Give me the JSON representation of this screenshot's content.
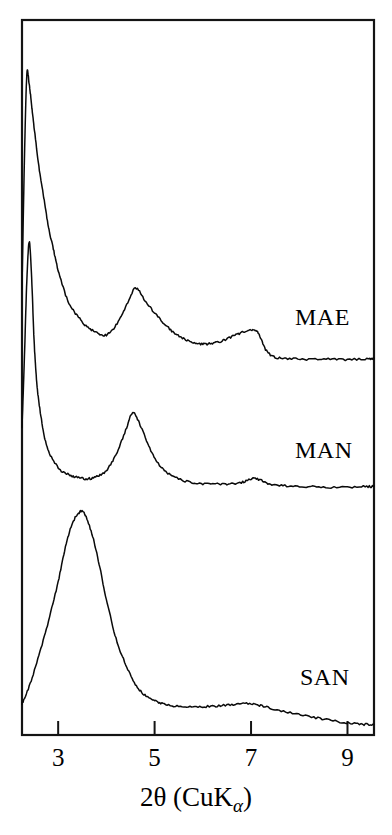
{
  "figure": {
    "name": "xrd-diffractogram",
    "background_color": "#ffffff",
    "line_color": "#0a0a0a",
    "frame_color": "#141414"
  },
  "axis": {
    "title_main": "2θ (CuK",
    "title_sub": "α",
    "title_close": ")",
    "title_full": "2θ (CuKα)",
    "tick_labels": [
      "3",
      "5",
      "7",
      "9"
    ]
  },
  "series_labels": {
    "mae": "MAE",
    "man": "MAN",
    "san": "SAN"
  },
  "chart_data": {
    "type": "line",
    "title": "",
    "subtitle": "",
    "xlabel": "2θ (CuKα)",
    "ylabel": "",
    "xlim": [
      2.25,
      9.55
    ],
    "ylim": [
      0,
      1
    ],
    "xticks": [
      3,
      5,
      7,
      9
    ],
    "yticks": [],
    "grid": false,
    "legend_position": "inline-right",
    "y_axis_note": "Intensity in arbitrary units; traces are vertically offset and not labeled.",
    "annotations": [
      {
        "text": "MAE",
        "x": 8.25,
        "series": "MAE"
      },
      {
        "text": "MAN",
        "x": 8.25,
        "series": "MAN"
      },
      {
        "text": "SAN",
        "x": 8.35,
        "series": "SAN"
      }
    ],
    "series": [
      {
        "name": "MAE",
        "offset_note": "top trace",
        "peaks": [
          {
            "x": 2.35,
            "relative_height": 1.0,
            "shape": "sharp"
          },
          {
            "x": 4.6,
            "relative_height": 0.3,
            "shape": "broad"
          },
          {
            "x": 7.0,
            "relative_height": 0.16,
            "shape": "broad"
          }
        ],
        "x": [
          2.25,
          2.3,
          2.35,
          2.4,
          2.45,
          2.5,
          2.6,
          2.7,
          2.8,
          2.9,
          3.0,
          3.2,
          3.4,
          3.6,
          3.8,
          4.0,
          4.2,
          4.4,
          4.6,
          4.8,
          5.0,
          5.2,
          5.4,
          5.6,
          5.8,
          6.0,
          6.2,
          6.4,
          6.6,
          6.8,
          7.0,
          7.15,
          7.3,
          7.5,
          7.8,
          8.2,
          8.6,
          9.0,
          9.4,
          9.55
        ],
        "y": [
          0.3,
          0.72,
          1.0,
          0.97,
          0.9,
          0.83,
          0.7,
          0.6,
          0.5,
          0.43,
          0.36,
          0.26,
          0.21,
          0.175,
          0.155,
          0.148,
          0.18,
          0.24,
          0.3,
          0.26,
          0.22,
          0.185,
          0.155,
          0.135,
          0.122,
          0.118,
          0.12,
          0.128,
          0.142,
          0.155,
          0.165,
          0.155,
          0.1,
          0.075,
          0.07,
          0.068,
          0.068,
          0.067,
          0.07,
          0.07
        ]
      },
      {
        "name": "MAN",
        "offset_note": "middle trace",
        "peaks": [
          {
            "x": 2.4,
            "relative_height": 1.0,
            "shape": "very sharp"
          },
          {
            "x": 4.6,
            "relative_height": 0.34,
            "shape": "moderate"
          },
          {
            "x": 7.0,
            "relative_height": 0.08,
            "shape": "small bump"
          }
        ],
        "x": [
          2.25,
          2.3,
          2.35,
          2.4,
          2.45,
          2.5,
          2.55,
          2.6,
          2.7,
          2.8,
          3.0,
          3.2,
          3.4,
          3.6,
          3.8,
          4.0,
          4.2,
          4.4,
          4.55,
          4.7,
          4.9,
          5.1,
          5.3,
          5.6,
          5.9,
          6.2,
          6.5,
          6.8,
          7.0,
          7.2,
          7.4,
          7.7,
          8.1,
          8.5,
          9.0,
          9.4,
          9.55
        ],
        "y": [
          0.28,
          0.55,
          0.85,
          1.0,
          0.86,
          0.62,
          0.47,
          0.38,
          0.26,
          0.19,
          0.125,
          0.1,
          0.088,
          0.082,
          0.09,
          0.115,
          0.175,
          0.27,
          0.34,
          0.29,
          0.2,
          0.135,
          0.1,
          0.075,
          0.065,
          0.062,
          0.062,
          0.068,
          0.082,
          0.078,
          0.062,
          0.055,
          0.052,
          0.05,
          0.05,
          0.052,
          0.052
        ]
      },
      {
        "name": "SAN",
        "offset_note": "bottom trace; broad amorphous halo",
        "peaks": [
          {
            "x": 3.5,
            "relative_height": 1.0,
            "shape": "very broad halo"
          },
          {
            "x": 7.0,
            "relative_height": 0.1,
            "shape": "faint bump"
          }
        ],
        "x": [
          2.25,
          2.4,
          2.6,
          2.8,
          3.0,
          3.15,
          3.3,
          3.45,
          3.55,
          3.7,
          3.85,
          4.0,
          4.2,
          4.4,
          4.6,
          4.8,
          5.0,
          5.2,
          5.5,
          5.8,
          6.1,
          6.4,
          6.7,
          7.0,
          7.2,
          7.5,
          7.9,
          8.3,
          8.7,
          9.1,
          9.4,
          9.55
        ],
        "y": [
          0.12,
          0.2,
          0.34,
          0.5,
          0.68,
          0.84,
          0.95,
          1.0,
          0.99,
          0.9,
          0.76,
          0.6,
          0.42,
          0.3,
          0.21,
          0.16,
          0.135,
          0.12,
          0.108,
          0.105,
          0.108,
          0.112,
          0.118,
          0.12,
          0.112,
          0.095,
          0.075,
          0.058,
          0.042,
          0.03,
          0.025,
          0.025
        ]
      }
    ]
  }
}
